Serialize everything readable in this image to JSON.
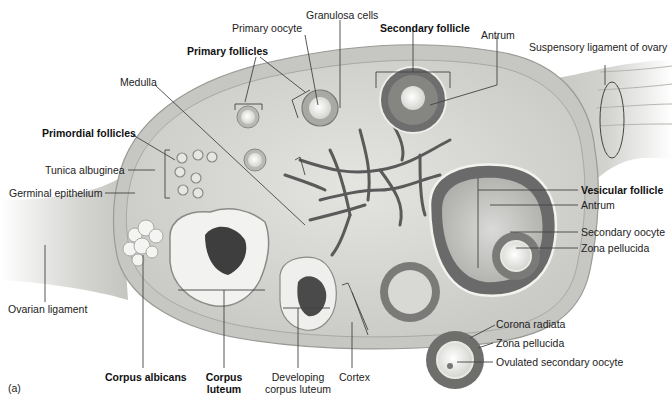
{
  "figure": {
    "panel_label": "(a)"
  },
  "labels": {
    "primary_oocyte": "Primary oocyte",
    "granulosa_cells": "Granulosa cells",
    "secondary_follicle": "Secondary follicle",
    "antrum_top": "Antrum",
    "suspensory_ligament": "Suspensory ligament of ovary",
    "primary_follicles": "Primary follicles",
    "medulla": "Medulla",
    "primordial_follicles": "Primordial follicles",
    "tunica_albuginea": "Tunica albuginea",
    "germinal_epithelium": "Germinal epithelium",
    "vesicular_follicle": "Vesicular follicle",
    "antrum_right": "Antrum",
    "secondary_oocyte": "Secondary oocyte",
    "zona_pellucida_right": "Zona pellucida",
    "ovarian_ligament": "Ovarian ligament",
    "corona_radiata": "Corona radiata",
    "zona_pellucida_ovulated": "Zona pellucida",
    "ovulated_secondary_oocyte": "Ovulated secondary oocyte",
    "corpus_albicans": "Corpus albicans",
    "corpus_luteum_line1": "Corpus",
    "corpus_luteum_line2": "luteum",
    "developing_corpus_luteum_line1": "Developing",
    "developing_corpus_luteum_line2": "corpus luteum",
    "cortex": "Cortex"
  },
  "colors": {
    "background": "#ffffff",
    "ovary_fill": "#d9d9d6",
    "capsule": "#bdbdb9",
    "ligament": "#cfcfcc",
    "follicle_dark": "#6e6e6e",
    "vessel": "#5a5a5a",
    "leader_line": "#444444"
  }
}
